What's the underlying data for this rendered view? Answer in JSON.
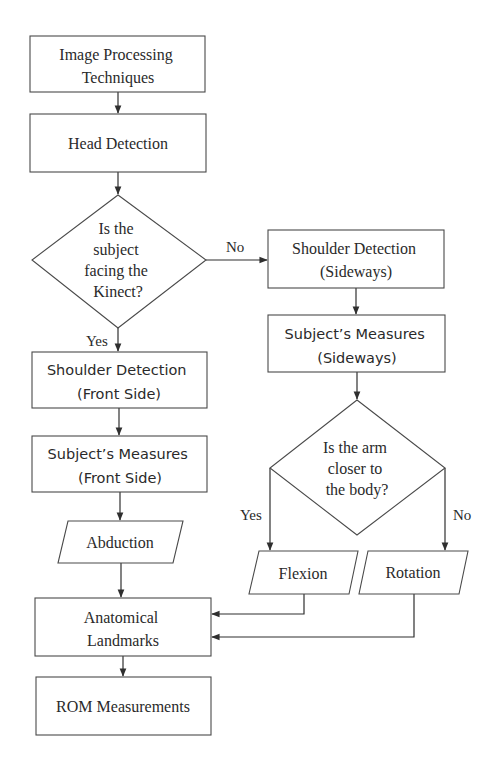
{
  "nodes": {
    "image_processing": {
      "lines": [
        "Image Processing",
        "Techniques"
      ],
      "shape": "process"
    },
    "head_detection": {
      "lines": [
        "Head Detection"
      ],
      "shape": "process"
    },
    "facing_decision": {
      "lines": [
        "Is the",
        "subject",
        "facing the",
        "Kinect?"
      ],
      "shape": "decision"
    },
    "shoulder_front": {
      "lines": [
        "Shoulder Detection",
        "(Front Side)"
      ],
      "shape": "process"
    },
    "measures_front": {
      "lines": [
        "Subject’s Measures",
        "(Front Side)"
      ],
      "shape": "process"
    },
    "abduction": {
      "lines": [
        "Abduction"
      ],
      "shape": "data"
    },
    "shoulder_side": {
      "lines": [
        "Shoulder Detection",
        "(Sideways)"
      ],
      "shape": "process"
    },
    "measures_side": {
      "lines": [
        "Subject’s Measures",
        "(Sideways)"
      ],
      "shape": "process"
    },
    "arm_decision": {
      "lines": [
        "Is the arm",
        "closer to",
        "the body?"
      ],
      "shape": "decision"
    },
    "flexion": {
      "lines": [
        "Flexion"
      ],
      "shape": "data"
    },
    "rotation": {
      "lines": [
        "Rotation"
      ],
      "shape": "data"
    },
    "landmarks": {
      "lines": [
        "Anatomical",
        "Landmarks"
      ],
      "shape": "process"
    },
    "rom": {
      "lines": [
        "ROM Measurements"
      ],
      "shape": "process"
    }
  },
  "edges": [
    {
      "from": "image_processing",
      "to": "head_detection",
      "label": ""
    },
    {
      "from": "head_detection",
      "to": "facing_decision",
      "label": ""
    },
    {
      "from": "facing_decision",
      "to": "shoulder_front",
      "label": "Yes"
    },
    {
      "from": "facing_decision",
      "to": "shoulder_side",
      "label": "No"
    },
    {
      "from": "shoulder_front",
      "to": "measures_front",
      "label": ""
    },
    {
      "from": "measures_front",
      "to": "abduction",
      "label": ""
    },
    {
      "from": "abduction",
      "to": "landmarks",
      "label": ""
    },
    {
      "from": "shoulder_side",
      "to": "measures_side",
      "label": ""
    },
    {
      "from": "measures_side",
      "to": "arm_decision",
      "label": ""
    },
    {
      "from": "arm_decision",
      "to": "flexion",
      "label": "Yes"
    },
    {
      "from": "arm_decision",
      "to": "rotation",
      "label": "No"
    },
    {
      "from": "flexion",
      "to": "landmarks",
      "label": ""
    },
    {
      "from": "rotation",
      "to": "landmarks",
      "label": ""
    },
    {
      "from": "landmarks",
      "to": "rom",
      "label": ""
    }
  ],
  "edge_labels": {
    "facing_yes": "Yes",
    "facing_no": "No",
    "arm_yes": "Yes",
    "arm_no": "No"
  }
}
